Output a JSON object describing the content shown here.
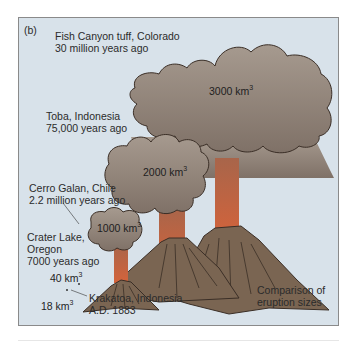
{
  "figure": {
    "panel_label": "(b)",
    "caption": [
      "Comparison of",
      "eruption sizes"
    ],
    "colors": {
      "background": "#d8e2ea",
      "ash_cloud": "#8d8075",
      "volcano": "#7a6552",
      "lava": "#c9603a",
      "outline": "#3a2e26"
    }
  },
  "eruptions": [
    {
      "name_line1": "Fish Canyon tuff, Colorado",
      "name_line2": "30 million years ago",
      "volume": "3000 km",
      "unit_exp": "3"
    },
    {
      "name_line1": "Toba, Indonesia",
      "name_line2": "75,000 years ago",
      "volume": "2000 km",
      "unit_exp": "3"
    },
    {
      "name_line1": "Cerro Galan, Chile",
      "name_line2": "2.2 million years ago",
      "volume": "1000 km",
      "unit_exp": "3"
    },
    {
      "name_line1": "Crater Lake,",
      "name_line2": "Oregon",
      "name_line3": "7000 years ago",
      "volume": "40 km",
      "unit_exp": "3"
    },
    {
      "name_line1": "Krakatoa, Indonesia",
      "name_line2": "A.D. 1883",
      "volume": "18 km",
      "unit_exp": "3"
    }
  ]
}
